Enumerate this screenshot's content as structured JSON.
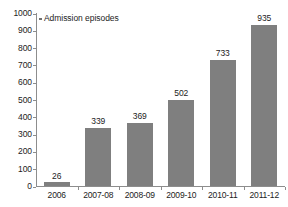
{
  "chart_data": {
    "type": "bar",
    "title": "",
    "xlabel": "",
    "ylabel": "",
    "categories": [
      "2006",
      "2007-08",
      "2008-09",
      "2009-10",
      "2010-11",
      "2011-12"
    ],
    "values": [
      26,
      339,
      369,
      502,
      733,
      935
    ],
    "series": [
      {
        "name": "Admission episodes",
        "values": [
          26,
          339,
          369,
          502,
          733,
          935
        ]
      }
    ],
    "ylim": [
      0,
      1000
    ],
    "ytick_labels": [
      "1000",
      "900",
      "800",
      "700",
      "600",
      "500",
      "400",
      "300",
      "200",
      "100",
      "0"
    ],
    "ytick_values": [
      1000,
      900,
      800,
      700,
      600,
      500,
      400,
      300,
      200,
      100,
      0
    ],
    "grid": false,
    "legend": {
      "position": "top-left",
      "entries": [
        "Admission episodes"
      ]
    },
    "colors": {
      "bar": "#7f7f7f",
      "axis": "#8d8d8d",
      "text": "#1c1c1c",
      "background": "#ffffff"
    },
    "value_labels": [
      "26",
      "339",
      "369",
      "502",
      "733",
      "935"
    ]
  }
}
